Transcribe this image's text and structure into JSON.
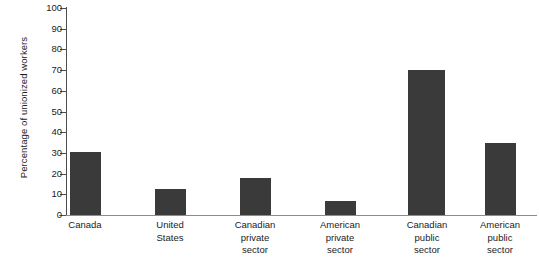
{
  "chart_data": {
    "type": "bar",
    "title": "",
    "xlabel": "",
    "ylabel": "Percentage of unionized workers",
    "ylim": [
      0,
      100
    ],
    "ytick_step": 10,
    "grid": false,
    "legend": null,
    "bar_color": "#3a3a3a",
    "axis_color": "#4d4d4d",
    "categories": [
      "Canada",
      "United States",
      "Canadian private sector",
      "American private sector",
      "Canadian public sector",
      "American public sector"
    ],
    "category_label_lines": [
      [
        "Canada"
      ],
      [
        "United",
        "States"
      ],
      [
        "Canadian",
        "private",
        "sector"
      ],
      [
        "American",
        "private",
        "sector"
      ],
      [
        "Canadian",
        "public",
        "sector"
      ],
      [
        "American",
        "public",
        "sector"
      ]
    ],
    "values": [
      30.5,
      12.5,
      18,
      7,
      70,
      35
    ],
    "ytick_labels": [
      "100",
      "90",
      "80",
      "70",
      "60",
      "50",
      "40",
      "30",
      "20",
      "10",
      "0"
    ],
    "ytick_values": [
      100,
      90,
      80,
      70,
      60,
      50,
      40,
      30,
      20,
      10,
      0
    ]
  },
  "layout": {
    "bar_left_px": [
      70,
      155,
      240,
      325,
      408,
      485
    ],
    "bar_width_px": [
      31,
      31,
      31,
      31,
      37,
      31
    ],
    "label_center_px": [
      85,
      170,
      255,
      340,
      427,
      500
    ]
  }
}
